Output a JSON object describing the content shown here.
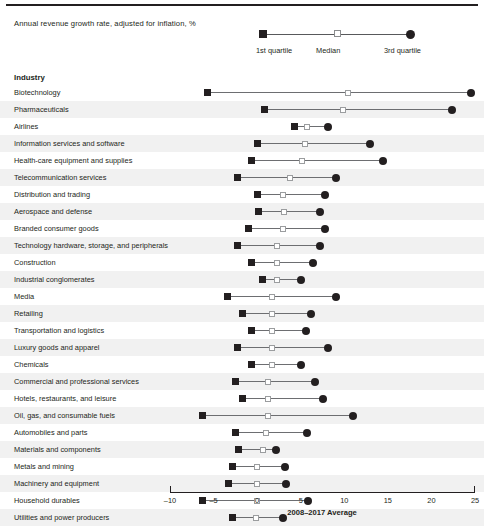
{
  "subtitle": "Annual revenue growth rate, adjusted for inflation, %",
  "legend": {
    "q1_label": "1st quartile",
    "median_label": "Median",
    "q3_label": "3rd quartile"
  },
  "table": {
    "industry_header": "Industry"
  },
  "axis": {
    "title": "2008–2017 Average",
    "tick_labels": [
      "–10",
      "–5",
      "0",
      "5",
      "10",
      "15",
      "20",
      "25"
    ]
  },
  "colors": {
    "q1_marker": "#231f20",
    "median_marker": "#ffffff",
    "median_border": "#9b9d9f",
    "q3_marker": "#231f20",
    "whisker": "#6d6e71",
    "row_shade": "#f1f1f1",
    "text": "#231f20"
  },
  "chart_data": {
    "type": "bar",
    "subtype": "quartile-range-dot-plot",
    "title": "",
    "subtitle": "Annual revenue growth rate, adjusted for inflation, %",
    "xlabel": "2008–2017 Average",
    "ylabel": "Industry",
    "xlim": [
      -10,
      25
    ],
    "xticks": [
      -10,
      -5,
      0,
      5,
      10,
      15,
      20,
      25
    ],
    "grid": false,
    "legend_position": "top-right",
    "series": [
      {
        "name": "1st quartile",
        "marker": "filled-square"
      },
      {
        "name": "Median",
        "marker": "open-square"
      },
      {
        "name": "3rd quartile",
        "marker": "filled-circle"
      }
    ],
    "categories": [
      "Biotechnology",
      "Pharmaceuticals",
      "Airlines",
      "Information services and software",
      "Health-care equipment and supplies",
      "Telecommunication services",
      "Distribution and trading",
      "Aerospace and defense",
      "Branded consumer goods",
      "Technology hardware, storage, and peripherals",
      "Construction",
      "Industrial conglomerates",
      "Media",
      "Retailing",
      "Transportation and logistics",
      "Luxury goods and apparel",
      "Chemicals",
      "Commercial and professional services",
      "Hotels, restaurants, and leisure",
      "Oil, gas, and consumable fuels",
      "Automobiles and parts",
      "Materials and components",
      "Metals and mining",
      "Machinery and equipment",
      "Household durables",
      "Utilities and power producers"
    ],
    "rows": [
      {
        "industry": "Biotechnology",
        "q1": -5.7,
        "median": 10.4,
        "q3": 24.5
      },
      {
        "industry": "Pharmaceuticals",
        "q1": 0.8,
        "median": 9.8,
        "q3": 22.4
      },
      {
        "industry": "Airlines",
        "q1": 4.3,
        "median": 5.7,
        "q3": 8.1
      },
      {
        "industry": "Information services and software",
        "q1": 0.0,
        "median": 5.5,
        "q3": 12.9
      },
      {
        "industry": "Health-care equipment and supplies",
        "q1": -0.6,
        "median": 5.2,
        "q3": 14.4
      },
      {
        "industry": "Telecommunication services",
        "q1": -2.2,
        "median": 3.8,
        "q3": 9.0
      },
      {
        "industry": "Distribution and trading",
        "q1": 0.0,
        "median": 3.0,
        "q3": 7.8
      },
      {
        "industry": "Aerospace and defense",
        "q1": 0.1,
        "median": 3.1,
        "q3": 7.2
      },
      {
        "industry": "Branded consumer goods",
        "q1": -1.0,
        "median": 3.0,
        "q3": 7.8
      },
      {
        "industry": "Technology hardware, storage, and peripherals",
        "q1": -2.2,
        "median": 2.3,
        "q3": 7.2
      },
      {
        "industry": "Construction",
        "q1": -0.6,
        "median": 2.3,
        "q3": 6.4
      },
      {
        "industry": "Industrial conglomerates",
        "q1": 0.6,
        "median": 2.3,
        "q3": 5.0
      },
      {
        "industry": "Media",
        "q1": -3.4,
        "median": 1.7,
        "q3": 9.0
      },
      {
        "industry": "Retailing",
        "q1": -1.7,
        "median": 1.7,
        "q3": 6.2
      },
      {
        "industry": "Transportation and logistics",
        "q1": -0.6,
        "median": 1.7,
        "q3": 5.6
      },
      {
        "industry": "Luxury goods and apparel",
        "q1": -2.3,
        "median": 1.7,
        "q3": 8.1
      },
      {
        "industry": "Chemicals",
        "q1": -0.6,
        "median": 1.7,
        "q3": 5.0
      },
      {
        "industry": "Commercial and professional services",
        "q1": -2.5,
        "median": 1.3,
        "q3": 6.6
      },
      {
        "industry": "Hotels, restaurants, and leisure",
        "q1": -1.7,
        "median": 1.3,
        "q3": 7.6
      },
      {
        "industry": "Oil, gas, and consumable fuels",
        "q1": -6.3,
        "median": 1.2,
        "q3": 11.0
      },
      {
        "industry": "Automobiles and parts",
        "q1": -2.5,
        "median": 1.0,
        "q3": 5.7
      },
      {
        "industry": "Materials and components",
        "q1": -2.1,
        "median": 0.7,
        "q3": 2.2
      },
      {
        "industry": "Metals and mining",
        "q1": -2.8,
        "median": 0.0,
        "q3": 3.2
      },
      {
        "industry": "Machinery and equipment",
        "q1": -3.3,
        "median": 0.0,
        "q3": 3.3
      },
      {
        "industry": "Household durables",
        "q1": -6.3,
        "median": 0.0,
        "q3": 5.8
      },
      {
        "industry": "Utilities and power producers",
        "q1": -2.8,
        "median": -0.1,
        "q3": 3.0
      }
    ]
  }
}
